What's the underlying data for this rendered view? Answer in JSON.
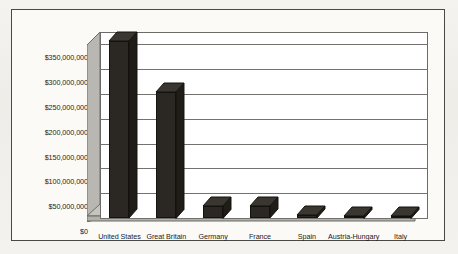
{
  "chart_data": {
    "type": "bar",
    "title": "",
    "subtitle": "",
    "xlabel": "",
    "ylabel": "",
    "categories": [
      "United States",
      "Great Britain",
      "Germany",
      "France",
      "Spain",
      "Austria-Hungary",
      "Italy"
    ],
    "values": [
      357000000,
      255000000,
      25000000,
      24000000,
      6000000,
      5000000,
      5000000
    ],
    "series": [
      {
        "name": "Amount",
        "values": [
          357000000,
          255000000,
          25000000,
          24000000,
          6000000,
          5000000,
          5000000
        ]
      }
    ],
    "ylim": [
      0,
      375000000
    ],
    "ytick_values": [
      0,
      50000000,
      100000000,
      150000000,
      200000000,
      250000000,
      300000000,
      350000000
    ],
    "ytick_labels": [
      "$0",
      "$50,000,000",
      "$100,000,000",
      "$150,000,000",
      "$200,000,000",
      "$250,000,000",
      "$300,000,000",
      "$350,000,000"
    ],
    "grid": true,
    "legend": false,
    "legend_position": "none",
    "style": "3d-column",
    "bar_color": "#2b2824",
    "plot_background": "#ffffff",
    "wall_color": "#b8b6b1",
    "floor_color": "#b8b6b1",
    "frame_color": "#4a4845",
    "page_background": "#f2f1ed"
  },
  "figure": {
    "border_color": "#4a4845",
    "background": "#fbfaf7"
  }
}
